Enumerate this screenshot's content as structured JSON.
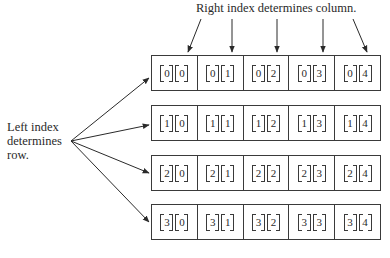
{
  "captions": {
    "top": "Right index determines column.",
    "left_line1": "Left index",
    "left_line2": "determines",
    "left_line3": "row."
  },
  "rows": [
    {
      "cells": [
        [
          "0",
          "0"
        ],
        [
          "0",
          "1"
        ],
        [
          "0",
          "2"
        ],
        [
          "0",
          "3"
        ],
        [
          "0",
          "4"
        ]
      ]
    },
    {
      "cells": [
        [
          "1",
          "0"
        ],
        [
          "1",
          "1"
        ],
        [
          "1",
          "2"
        ],
        [
          "1",
          "3"
        ],
        [
          "1",
          "4"
        ]
      ]
    },
    {
      "cells": [
        [
          "2",
          "0"
        ],
        [
          "2",
          "1"
        ],
        [
          "2",
          "2"
        ],
        [
          "2",
          "3"
        ],
        [
          "2",
          "4"
        ]
      ]
    },
    {
      "cells": [
        [
          "3",
          "0"
        ],
        [
          "3",
          "1"
        ],
        [
          "3",
          "2"
        ],
        [
          "3",
          "3"
        ],
        [
          "3",
          "4"
        ]
      ]
    }
  ],
  "colors": {
    "line": "#3a3a3a",
    "text": "#2a2a2a",
    "background": "#ffffff"
  }
}
